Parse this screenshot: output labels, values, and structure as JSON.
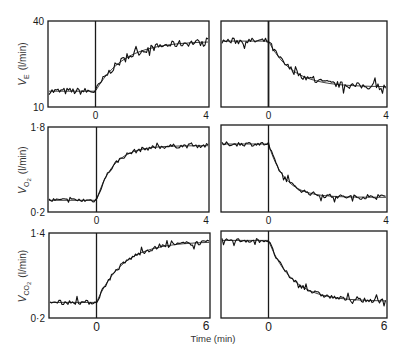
{
  "figure": {
    "x_axis_label": "Time (min)",
    "colors": {
      "ink": "#1a1a1a",
      "background": "#ffffff"
    }
  },
  "chart_data": [
    {
      "type": "line",
      "panel": "VE-on",
      "ylabel": "V̇E (l/min)",
      "xlabel": "",
      "xticks": [
        "0",
        "4"
      ],
      "yticks": [
        "40",
        "10"
      ],
      "ylim": [
        10,
        40
      ],
      "xlim": [
        -1.6,
        4
      ],
      "step_time": 0,
      "baseline": 15.5,
      "final": 33,
      "direction": "on",
      "tau": 1.0,
      "noise": 1.2
    },
    {
      "type": "line",
      "panel": "VE-off",
      "ylabel": "",
      "xticks": [
        "0",
        "4"
      ],
      "yticks": [],
      "ylim": [
        10,
        40
      ],
      "xlim": [
        -1.6,
        4
      ],
      "step_time": 0,
      "baseline": 33,
      "final": 17,
      "direction": "off",
      "tau": 0.8,
      "noise": 1.1
    },
    {
      "type": "line",
      "panel": "VO2-on",
      "ylabel": "V̇O2 (l/min)",
      "xticks": [
        "0",
        "4"
      ],
      "yticks": [
        "1·8",
        "0·2"
      ],
      "ylim": [
        0.2,
        1.8
      ],
      "xlim": [
        -1.6,
        4
      ],
      "step_time": 0,
      "baseline": 0.42,
      "final": 1.45,
      "direction": "on",
      "tau": 0.6,
      "noise": 0.04
    },
    {
      "type": "line",
      "panel": "VO2-off",
      "ylabel": "",
      "xticks": [
        "0",
        "4"
      ],
      "yticks": [],
      "ylim": [
        0.2,
        1.8
      ],
      "xlim": [
        -1.6,
        4
      ],
      "step_time": 0,
      "baseline": 1.45,
      "final": 0.47,
      "direction": "off",
      "tau": 0.55,
      "noise": 0.04
    },
    {
      "type": "line",
      "panel": "VCO2-on",
      "ylabel": "V̇CO2 (l/min)",
      "xticks": [
        "0",
        "6"
      ],
      "yticks": [
        "1·4",
        "0·2"
      ],
      "ylim": [
        0.2,
        1.4
      ],
      "xlim": [
        -2.4,
        6
      ],
      "step_time": 0,
      "baseline": 0.42,
      "final": 1.28,
      "direction": "on",
      "tau": 1.4,
      "noise": 0.03
    },
    {
      "type": "line",
      "panel": "VCO2-off",
      "ylabel": "",
      "xticks": [
        "0",
        "6"
      ],
      "yticks": [],
      "ylim": [
        0.2,
        1.4
      ],
      "xlim": [
        -2.4,
        6
      ],
      "step_time": 0,
      "baseline": 1.27,
      "final": 0.43,
      "direction": "off",
      "tau": 1.2,
      "noise": 0.03
    }
  ]
}
